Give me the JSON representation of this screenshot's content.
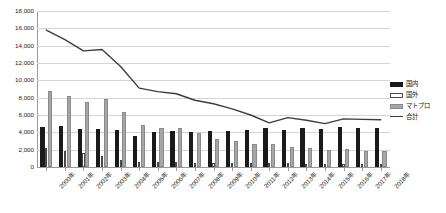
{
  "chart_data": {
    "type": "bar",
    "title": "",
    "xlabel": "",
    "ylabel": "",
    "ylim": [
      0,
      18000
    ],
    "ytick_step": 2000,
    "grid": true,
    "legend_position": "right",
    "categories": [
      "2000年",
      "2001年",
      "2002年",
      "2003年",
      "2004年",
      "2005年",
      "2006年",
      "2007年",
      "2008年",
      "2009年",
      "2010年",
      "2011年",
      "2012年",
      "2013年",
      "2014年",
      "2015年",
      "2016年",
      "2017年",
      "2018年"
    ],
    "ytick_labels": [
      "0",
      "2,000",
      "4,000",
      "6,000",
      "8,000",
      "10,000",
      "12,000",
      "14,000",
      "16,000",
      "18,000"
    ],
    "ytick_values": [
      0,
      2000,
      4000,
      6000,
      8000,
      10000,
      12000,
      14000,
      16000,
      18000
    ],
    "series": [
      {
        "name": "国内",
        "kind": "bar",
        "color": "#1a1a1a",
        "values": [
          4650,
          4750,
          4350,
          4400,
          4300,
          3550,
          4050,
          4150,
          4000,
          4100,
          4150,
          4250,
          4500,
          4300,
          4500,
          4400,
          4600,
          4450,
          4500
        ]
      },
      {
        "name": "国外",
        "kind": "bar",
        "color": "#ffffff",
        "values": [
          2250,
          1900,
          1600,
          1300,
          850,
          600,
          600,
          550,
          500,
          500,
          500,
          450,
          450,
          450,
          400,
          400,
          400,
          400,
          400
        ]
      },
      {
        "name": "マトプロ",
        "kind": "bar",
        "color": "#a6a6a6",
        "values": [
          8800,
          8150,
          7450,
          7900,
          6300,
          4800,
          4500,
          4450,
          3900,
          3250,
          3000,
          2700,
          2650,
          2350,
          2150,
          1950,
          2100,
          1850,
          1800
        ]
      },
      {
        "name": "合計",
        "kind": "line",
        "color": "#3d3d3d",
        "values": [
          15800,
          14700,
          13400,
          13550,
          11600,
          9100,
          8700,
          8450,
          7700,
          7300,
          6700,
          6000,
          5100,
          5700,
          5400,
          5000,
          5550,
          5500,
          5450
        ]
      }
    ]
  },
  "legend": {
    "items": [
      {
        "label": "国内",
        "swatch": "filled-black"
      },
      {
        "label": "国外",
        "swatch": "outlined-white"
      },
      {
        "label": "マトプロ",
        "swatch": "filled-gray"
      },
      {
        "label": "合計",
        "swatch": "line"
      }
    ]
  }
}
